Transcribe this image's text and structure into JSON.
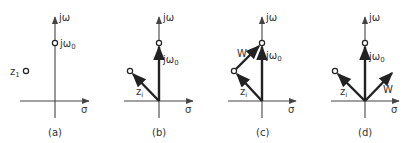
{
  "figure": {
    "axis_labels": {
      "imag": "jω",
      "real": "σ"
    },
    "point_labels": {
      "jw0_main": "jω",
      "jw0_sub": "0",
      "z_main": "z",
      "z_sub_a": "1",
      "z_sub": "i",
      "w": "W"
    },
    "panels": [
      {
        "id": "a",
        "caption": "(a)",
        "description": "Pole z1 and point jω0 in the s-plane"
      },
      {
        "id": "b",
        "caption": "(b)",
        "description": "Vectors z_i and jω0 from origin"
      },
      {
        "id": "c",
        "caption": "(c)",
        "description": "W = jω0 − z_i drawn from z_i to jω0"
      },
      {
        "id": "d",
        "caption": "(d)",
        "description": "W translated to origin"
      }
    ]
  }
}
